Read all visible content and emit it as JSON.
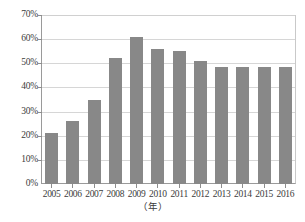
{
  "chart_data": {
    "type": "bar",
    "title": "",
    "subtitle": "",
    "xlabel": "（年）",
    "ylabel": "",
    "categories": [
      "2005",
      "2006",
      "2007",
      "2008",
      "2009",
      "2010",
      "2011",
      "2012",
      "2013",
      "2014",
      "2015",
      "2016"
    ],
    "values": [
      21,
      26,
      35,
      52,
      61,
      56,
      55,
      51,
      48.5,
      48.5,
      48.5,
      48.5
    ],
    "series": [
      {
        "name": "",
        "values": [
          21,
          26,
          35,
          52,
          61,
          56,
          55,
          51,
          48.5,
          48.5,
          48.5,
          48.5
        ]
      }
    ],
    "ylim": [
      0,
      70
    ],
    "ytick_values": [
      0,
      10,
      20,
      30,
      40,
      50,
      60,
      70
    ],
    "ytick_labels": [
      "0%",
      "10%",
      "20%",
      "30%",
      "40%",
      "50%",
      "60%",
      "70%"
    ],
    "grid": "horizontal",
    "legend": "none",
    "bar_color": "#888888",
    "gridline_color": "#d6d6d6",
    "axis_color": "#9a9a9a",
    "text_color": "#3b3b3b",
    "background": "#ffffff"
  },
  "axes": {
    "x_axis_title": "（年）",
    "y_axis_title": ""
  }
}
